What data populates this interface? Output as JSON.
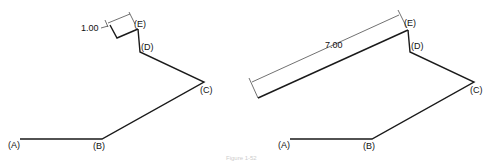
{
  "figures": [
    {
      "name": "left",
      "points": {
        "A": "(A)",
        "B": "(B)",
        "C": "(C)",
        "D": "(D)",
        "E": "(E)"
      },
      "dimension": "1.00"
    },
    {
      "name": "right",
      "points": {
        "A": "(A)",
        "B": "(B)",
        "C": "(C)",
        "D": "(D)",
        "E": "(E)"
      },
      "dimension": "7.00"
    }
  ],
  "caption": "Figure 1-52"
}
